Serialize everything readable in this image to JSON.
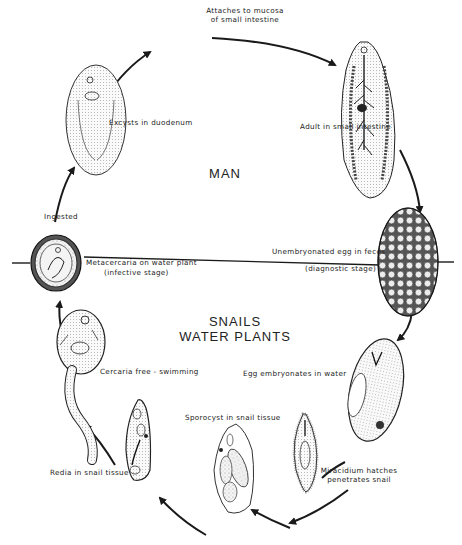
{
  "diagram": {
    "type": "life-cycle",
    "zones": {
      "upper": "MAN",
      "lower_line1": "SNAILS",
      "lower_line2": "WATER PLANTS"
    },
    "stages": [
      {
        "id": "attach",
        "label_line1": "Attaches to mucosa",
        "label_line2": "of small intestine"
      },
      {
        "id": "adult",
        "label": "Adult in small intestine"
      },
      {
        "id": "egg-feces",
        "label": "Unembryonated egg in feces",
        "sublabel": "(diagnostic stage)"
      },
      {
        "id": "egg-water",
        "label": "Egg embryonates in water"
      },
      {
        "id": "miracidium",
        "label_line1": "Miracidium hatches",
        "label_line2": "penetrates snail"
      },
      {
        "id": "sporocyst",
        "label": "Sporocyst in snail tissue"
      },
      {
        "id": "redia",
        "label": "Redia in snail tissue"
      },
      {
        "id": "cercaria",
        "label": "Cercaria free - swimming"
      },
      {
        "id": "metacercaria",
        "label": "Metacercaria on water plant",
        "sublabel": "(infective stage)"
      },
      {
        "id": "ingested",
        "label": "Ingested"
      },
      {
        "id": "excyst",
        "label": "Excysts in duodenum"
      }
    ],
    "colors": {
      "ink": "#1a1a1a",
      "paper": "#ffffff",
      "stipple": "#e8e8e8"
    }
  }
}
